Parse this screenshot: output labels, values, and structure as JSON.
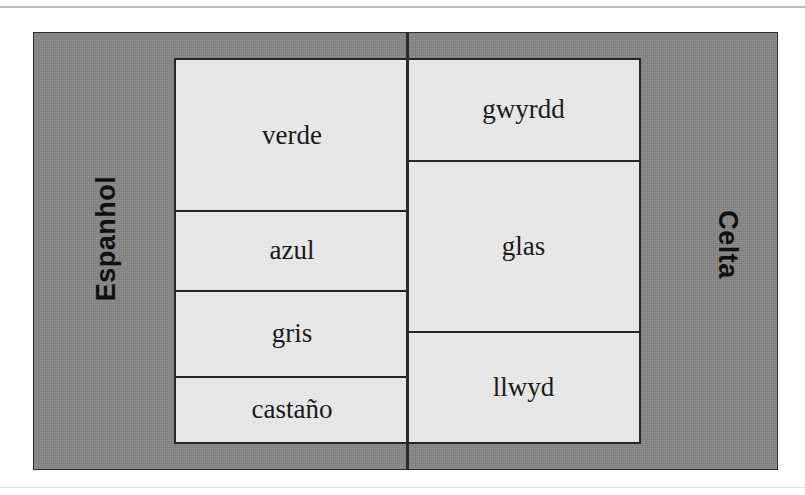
{
  "figure": {
    "type": "correspondence-diagram",
    "languages": {
      "left_label": "Espanhol",
      "right_label": "Celta"
    },
    "columns": [
      {
        "language": "Espanhol",
        "terms": [
          {
            "label": "verde",
            "height_units": 154
          },
          {
            "label": "azul",
            "height_units": 80
          },
          {
            "label": "gris",
            "height_units": 86
          },
          {
            "label": "castaño",
            "height_units": 66
          }
        ]
      },
      {
        "language": "Celta",
        "terms": [
          {
            "label": "gwyrdd",
            "height_units": 102
          },
          {
            "label": "glas",
            "height_units": 173
          },
          {
            "label": "llwyd",
            "height_units": 111
          }
        ]
      }
    ],
    "colors": {
      "panel_background": "#868686",
      "cell_background": "#e9e9e9",
      "border": "#262626",
      "text": "#1a1a1a"
    }
  }
}
